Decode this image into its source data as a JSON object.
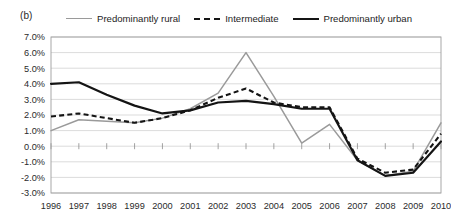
{
  "panel": {
    "label": "(b)"
  },
  "legend": {
    "position": "top",
    "items": [
      {
        "label": "Predominantly rural",
        "style": "solid",
        "color": "#9a9a9a",
        "name": "rural"
      },
      {
        "label": "Intermediate",
        "style": "dashed",
        "color": "#141414",
        "name": "intermediate"
      },
      {
        "label": "Predominantly urban",
        "style": "solid-thick",
        "color": "#141414",
        "name": "urban"
      }
    ]
  },
  "chart_data": {
    "type": "line",
    "title": "",
    "subtitle": "",
    "xlabel": "",
    "ylabel": "",
    "grid": true,
    "legend_position": "top",
    "categories": [
      "1996",
      "1997",
      "1998",
      "1999",
      "2000",
      "2001",
      "2002",
      "2003",
      "2004",
      "2005",
      "2006",
      "2007",
      "2008",
      "2009",
      "2010"
    ],
    "x": [
      1996,
      1997,
      1998,
      1999,
      2000,
      2001,
      2002,
      2003,
      2004,
      2005,
      2006,
      2007,
      2008,
      2009,
      2010
    ],
    "ylim": [
      -3.0,
      7.0
    ],
    "ytick_values": [
      7.0,
      6.0,
      5.0,
      4.0,
      3.0,
      2.0,
      1.0,
      0.0,
      -1.0,
      -2.0,
      -3.0
    ],
    "ytick_labels": [
      "7.0%",
      "6.0%",
      "5.0%",
      "4.0%",
      "3.0%",
      "2.0%",
      "1.0%",
      "0.0%",
      "-1.0%",
      "-2.0%",
      "-3.0%"
    ],
    "series": [
      {
        "name": "Predominantly rural",
        "color": "#9a9a9a",
        "style": "solid",
        "values": [
          1.0,
          1.7,
          1.6,
          1.5,
          1.8,
          2.4,
          3.4,
          6.0,
          3.2,
          0.2,
          1.4,
          -0.9,
          -1.9,
          -1.6,
          1.5
        ]
      },
      {
        "name": "Intermediate",
        "color": "#141414",
        "style": "dashed",
        "values": [
          1.9,
          2.1,
          1.8,
          1.5,
          1.8,
          2.3,
          3.1,
          3.7,
          2.8,
          2.5,
          2.5,
          -0.8,
          -1.7,
          -1.5,
          0.8
        ]
      },
      {
        "name": "Predominantly urban",
        "color": "#141414",
        "style": "solid",
        "values": [
          4.0,
          4.1,
          3.3,
          2.6,
          2.1,
          2.3,
          2.8,
          2.9,
          2.7,
          2.4,
          2.4,
          -0.9,
          -1.9,
          -1.7,
          0.3
        ]
      }
    ]
  }
}
